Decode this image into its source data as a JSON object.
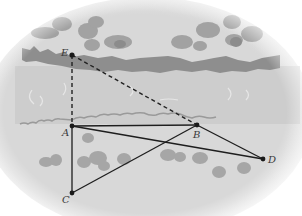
{
  "diagram": {
    "type": "geometry-river-width",
    "points": [
      {
        "id": "E",
        "label": "E",
        "x": 72,
        "y": 55,
        "lx": 61,
        "ly": 56
      },
      {
        "id": "A",
        "label": "A",
        "x": 72,
        "y": 126,
        "lx": 62,
        "ly": 136
      },
      {
        "id": "B",
        "label": "B",
        "x": 197,
        "y": 125,
        "lx": 193,
        "ly": 138
      },
      {
        "id": "D",
        "label": "D",
        "x": 263,
        "y": 159,
        "lx": 268,
        "ly": 163
      },
      {
        "id": "C",
        "label": "C",
        "x": 72,
        "y": 193,
        "lx": 62,
        "ly": 203
      }
    ],
    "solid_segments": [
      [
        "A",
        "B"
      ],
      [
        "A",
        "C"
      ],
      [
        "A",
        "D"
      ],
      [
        "B",
        "D"
      ],
      [
        "C",
        "B"
      ]
    ],
    "dashed_segments": [
      [
        "E",
        "A"
      ],
      [
        "E",
        "B"
      ]
    ],
    "colors": {
      "background_land": "#d9d9d9",
      "river": "#cfcfcf",
      "far_bank": "#8c8c8c",
      "near_bank": "#9a9a9a",
      "bushes": "#a6a6a6",
      "lines": "#1e1e1e",
      "labels": "#3a3a3a"
    }
  }
}
